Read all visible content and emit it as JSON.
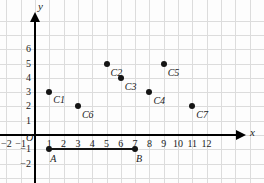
{
  "chart_data": {
    "type": "scatter",
    "title": "",
    "xlabel": "x",
    "ylabel": "y",
    "xlim": [
      -2.5,
      13
    ],
    "ylim": [
      -2.5,
      6.8
    ],
    "grid": true,
    "legend": "none",
    "x_ticks": [
      "-2",
      "-1",
      "1",
      "2",
      "3",
      "4",
      "5",
      "6",
      "7",
      "8",
      "9",
      "10",
      "11",
      "12"
    ],
    "x_tick_values": [
      -2,
      -1,
      1,
      2,
      3,
      4,
      5,
      6,
      7,
      8,
      9,
      10,
      11,
      12
    ],
    "y_ticks": [
      "6",
      "5",
      "4",
      "3",
      "2",
      "1",
      "-1",
      "-2"
    ],
    "y_tick_values": [
      6,
      5,
      4,
      3,
      2,
      1,
      -1,
      -2
    ],
    "origin_label": "O",
    "points": [
      {
        "label": "C1",
        "x": 1,
        "y": 3,
        "label_dx": 4,
        "label_dy": 9
      },
      {
        "label": "C2",
        "x": 5,
        "y": 5,
        "label_dx": 4,
        "label_dy": 10
      },
      {
        "label": "C3",
        "x": 6,
        "y": 4,
        "label_dx": 4,
        "label_dy": 10
      },
      {
        "label": "C4",
        "x": 8,
        "y": 3,
        "label_dx": 4,
        "label_dy": 10
      },
      {
        "label": "C5",
        "x": 9,
        "y": 5,
        "label_dx": 4,
        "label_dy": 10
      },
      {
        "label": "C6",
        "x": 3,
        "y": 2,
        "label_dx": 4,
        "label_dy": 10
      },
      {
        "label": "C7",
        "x": 11,
        "y": 2,
        "label_dx": 4,
        "label_dy": 10
      }
    ],
    "segment": {
      "name": "AB",
      "start": {
        "label": "A",
        "x": 1,
        "y": -1
      },
      "end": {
        "label": "B",
        "x": 7,
        "y": -1
      }
    },
    "colors": {
      "point": "#141414",
      "axis": "#000000",
      "grid": "#dcdcdc",
      "background": "#fdfdfd",
      "text": "#1a1a1a"
    }
  }
}
